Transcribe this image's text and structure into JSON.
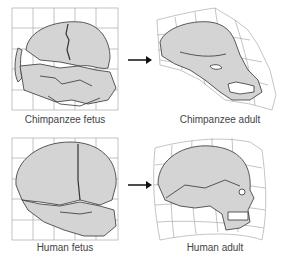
{
  "figure": {
    "panels": [
      {
        "id": "chimp-fetus",
        "label": "Chimpanzee fetus"
      },
      {
        "id": "chimp-adult",
        "label": "Chimpanzee adult"
      },
      {
        "id": "human-fetus",
        "label": "Human fetus"
      },
      {
        "id": "human-adult",
        "label": "Human adult"
      }
    ],
    "arrows": [
      "right-arrow",
      "right-arrow"
    ],
    "colors": {
      "bone_fill": "#d4d4d4",
      "outline": "#333333",
      "grid": "#aaaaaa"
    }
  }
}
